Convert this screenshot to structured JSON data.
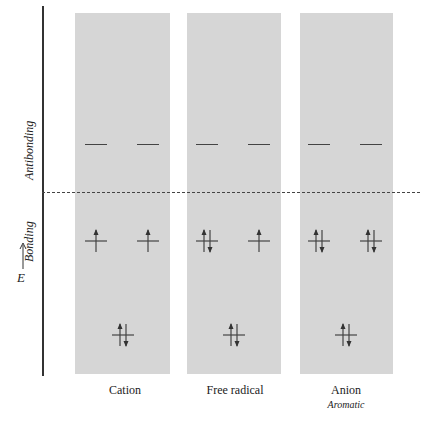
{
  "axis": {
    "energy_label": "E",
    "region_labels": {
      "antibonding": "Antibonding",
      "bonding": "Bonding"
    }
  },
  "colors": {
    "panel": "#d6d6d6",
    "line": "#444444"
  },
  "columns": [
    {
      "label": "Cation",
      "sublabel": "",
      "antibonding": [
        "empty",
        "empty"
      ],
      "bonding_degenerate": [
        "up",
        "up"
      ],
      "bonding_lowest": "paired"
    },
    {
      "label": "Free radical",
      "sublabel": "",
      "antibonding": [
        "empty",
        "empty"
      ],
      "bonding_degenerate": [
        "paired",
        "up"
      ],
      "bonding_lowest": "paired"
    },
    {
      "label": "Anion",
      "sublabel": "Aromatic",
      "antibonding": [
        "empty",
        "empty"
      ],
      "bonding_degenerate": [
        "paired",
        "paired"
      ],
      "bonding_lowest": "paired"
    }
  ]
}
